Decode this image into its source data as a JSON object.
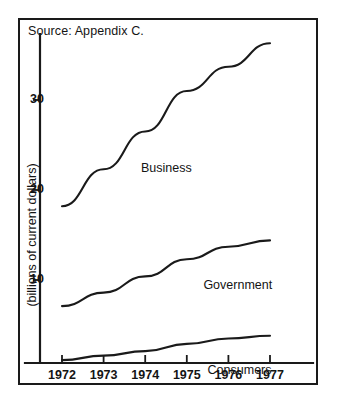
{
  "figure": {
    "source_note": "Source: Appendix C.",
    "axis_color": "#1a1a1a",
    "line_color": "#1a1a1a",
    "background": "#ffffff"
  },
  "chart_data": {
    "type": "line",
    "title": "",
    "subtitle": "",
    "xlabel": "",
    "ylabel": "(billions of current dollars)",
    "categories": [
      "1972",
      "1973",
      "1974",
      "1975",
      "1976",
      "1977"
    ],
    "x": [
      1972,
      1973,
      1974,
      1975,
      1976,
      1977
    ],
    "ylim": [
      0,
      38
    ],
    "xlim": [
      1972,
      1977
    ],
    "yticks": [
      10,
      20,
      30
    ],
    "ytick_labels": [
      "10",
      "20",
      "30"
    ],
    "xticks": [
      1972,
      1973,
      1974,
      1975,
      1976,
      1977
    ],
    "xtick_labels": [
      "1972",
      "1973",
      "1974",
      "1975",
      "1976",
      "1977"
    ],
    "grid": false,
    "legend": "inline-labels",
    "series": [
      {
        "name": "Business",
        "values": [
          18.2,
          22.3,
          26.5,
          31.0,
          33.7,
          36.3
        ],
        "label": "Business"
      },
      {
        "name": "Government",
        "values": [
          7.1,
          8.6,
          10.4,
          12.3,
          13.7,
          14.4
        ],
        "label": "Government"
      },
      {
        "name": "Consumers",
        "values": [
          1.1,
          1.6,
          2.1,
          2.9,
          3.5,
          3.8
        ],
        "label": "Consumers"
      }
    ],
    "annotations": [
      {
        "text": "Source: Appendix C.",
        "position": "top-left"
      },
      {
        "text": "Business",
        "position": "on-line"
      },
      {
        "text": "Government",
        "position": "on-line"
      },
      {
        "text": "Consumers",
        "position": "on-line"
      }
    ]
  }
}
